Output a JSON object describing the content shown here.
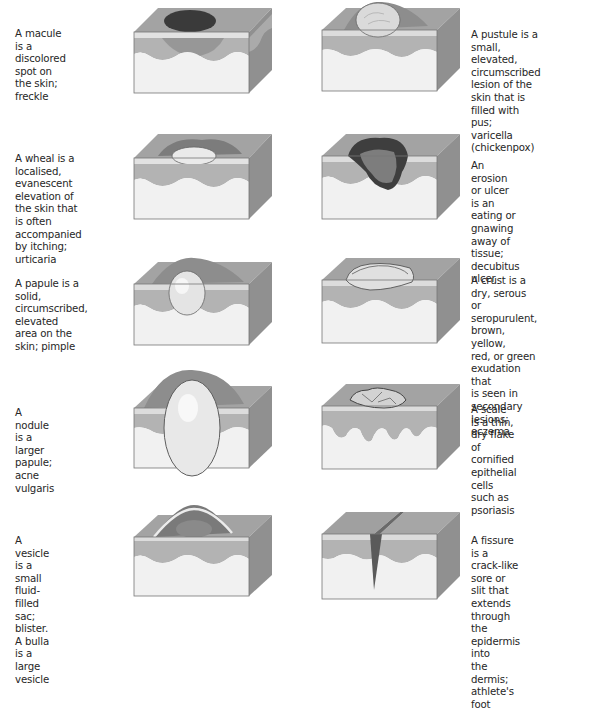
{
  "figure": {
    "left_column": [
      {
        "id": "macule",
        "lines": [
          "A macule is a discolored",
          "spot on the skin; freckle"
        ]
      },
      {
        "id": "wheal",
        "lines": [
          "A wheal is a localised,",
          "evanescent elevation of",
          "the skin that is often",
          "accompanied by itching;",
          "urticaria"
        ]
      },
      {
        "id": "papule",
        "lines": [
          "A papule is a solid,",
          "circumscribed, elevated",
          "area on the skin; pimple"
        ]
      },
      {
        "id": "nodule",
        "lines": [
          "A nodule is a larger",
          "papule; acne vulgaris"
        ]
      },
      {
        "id": "vesicle",
        "lines": [
          "A vesicle is a small fluid-",
          "filled sac; blister. A bulla",
          "is a large vesicle"
        ]
      }
    ],
    "right_column": [
      {
        "id": "pustule",
        "lines": [
          "A pustule is a small, elevated,",
          "circumscribed lesion of the",
          "skin that is filled with pus;",
          "varicella (chickenpox)"
        ]
      },
      {
        "id": "erosion",
        "lines": [
          "An erosion or ulcer is an",
          "eating or gnawing away of",
          "tissue; decubitus ulcer"
        ]
      },
      {
        "id": "crust",
        "lines": [
          "A crust is a dry, serous or",
          "seropurulent, brown, yellow,",
          "red, or green exudation that",
          "is seen in secondary lesions;",
          "eczema"
        ]
      },
      {
        "id": "scale",
        "lines": [
          "A scale is a thin, dry flake",
          "of cornified epithelial",
          "cells such as psoriasis"
        ]
      },
      {
        "id": "fissure",
        "lines": [
          "A fissure is a crack-like",
          "sore or slit that extends",
          "through the epidermis into",
          "the dermis; athlete's foot"
        ]
      }
    ],
    "colors": {
      "top_face": "#9a9a9a",
      "epidermis": "#d9d9d9",
      "dermis_band": "#a8a8a8",
      "subcutis": "#f1f1f1",
      "side_face": "#8a8a8a",
      "lesion_dark": "#3c3c3c",
      "lesion_light": "#e6e6e6"
    }
  }
}
